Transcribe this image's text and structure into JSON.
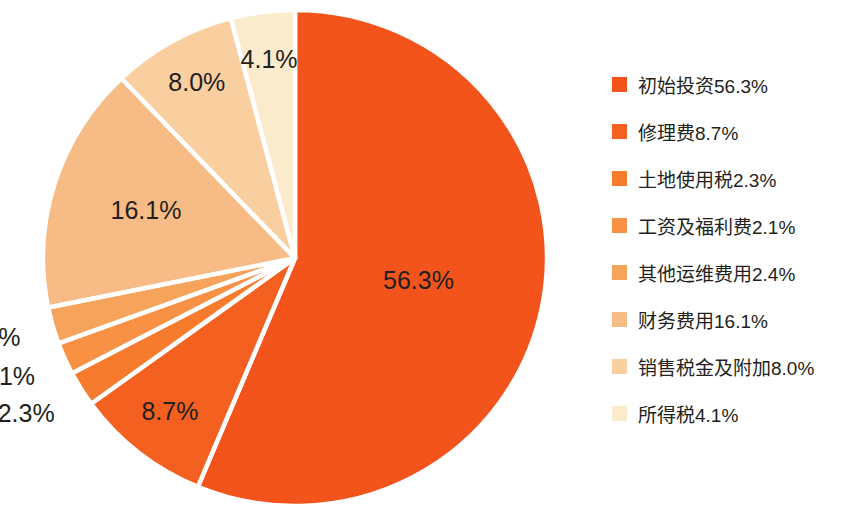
{
  "chart_data": {
    "type": "pie",
    "title": "",
    "legend_position": "right",
    "start_angle_deg": 0,
    "direction": "clockwise",
    "categories": [
      "初始投资",
      "修理费",
      "土地使用税",
      "工资及福利费",
      "其他运维费用",
      "财务费用",
      "销售税金及附加",
      "所得税"
    ],
    "values": [
      56.3,
      8.7,
      2.3,
      2.1,
      2.4,
      16.1,
      8.0,
      4.1
    ],
    "value_labels": [
      "56.3%",
      "8.7%",
      "2.3%",
      "2.1%",
      "2.4%",
      "16.1%",
      "8.0%",
      "4.1%"
    ],
    "colors": [
      "#F2541B",
      "#F4601F",
      "#F67B2C",
      "#F89143",
      "#F6A45C",
      "#F7BC85",
      "#F9CFA0",
      "#FBEBCD"
    ],
    "legend_entries": [
      "初始投资56.3%",
      "修理费8.7%",
      "土地使用税2.3%",
      "工资及福利费2.1%",
      "其他运维费用2.4%",
      "财务费用16.1%",
      "销售税金及附加8.0%",
      "所得税4.1%"
    ],
    "label_placement": [
      "inside",
      "inside",
      "outside",
      "outside",
      "outside",
      "inside",
      "inside",
      "inside"
    ],
    "geometry": {
      "center_x": 295,
      "center_y": 258,
      "radius_x": 252,
      "radius_y": 248,
      "separator_color": "#FFFFFF"
    }
  }
}
